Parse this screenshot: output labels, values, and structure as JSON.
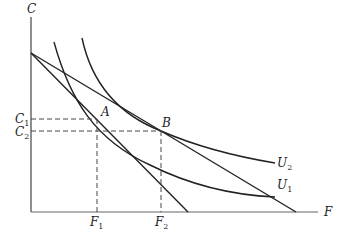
{
  "diagram": {
    "type": "indifference-curve diagram",
    "axes": {
      "y_label": "C",
      "x_label": "F"
    },
    "points": [
      {
        "name": "A",
        "label": "A"
      },
      {
        "name": "B",
        "label": "B"
      }
    ],
    "curves": [
      {
        "name": "U1",
        "label": "U",
        "sub": "1"
      },
      {
        "name": "U2",
        "label": "U",
        "sub": "2"
      }
    ],
    "y_ticks": [
      {
        "label": "C",
        "sub": "1"
      },
      {
        "label": "C",
        "sub": "2"
      }
    ],
    "x_ticks": [
      {
        "label": "F",
        "sub": "1"
      },
      {
        "label": "F",
        "sub": "2"
      }
    ],
    "colors": {
      "line": "#222222",
      "axis": "#555555"
    }
  }
}
